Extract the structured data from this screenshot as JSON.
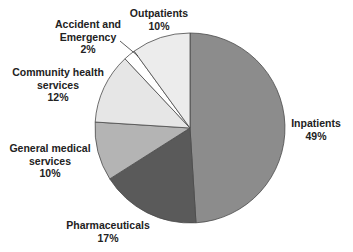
{
  "chart_data": {
    "type": "pie",
    "title": "",
    "start_angle": "12 o'clock, clockwise",
    "categories": [
      "Inpatients",
      "Pharmaceuticals",
      "General medical services",
      "Community health services",
      "Accident and Emergency",
      "Outpatients"
    ],
    "values": [
      49,
      17,
      10,
      12,
      2,
      10
    ],
    "unit": "%",
    "colors": [
      "#8c8c8c",
      "#5a5a5a",
      "#b4b4b4",
      "#e6e6e6",
      "#ffffff",
      "#ececec"
    ],
    "legend": "none (direct labels)",
    "labels": [
      {
        "lines": [
          "Inpatients"
        ],
        "value": "49%"
      },
      {
        "lines": [
          "Pharmaceuticals"
        ],
        "value": "17%"
      },
      {
        "lines": [
          "General medical",
          "services"
        ],
        "value": "10%"
      },
      {
        "lines": [
          "Community health",
          "services"
        ],
        "value": "12%"
      },
      {
        "lines": [
          "Accident and",
          "Emergency"
        ],
        "value": "2%"
      },
      {
        "lines": [
          "Outpatients"
        ],
        "value": "10%"
      }
    ]
  }
}
